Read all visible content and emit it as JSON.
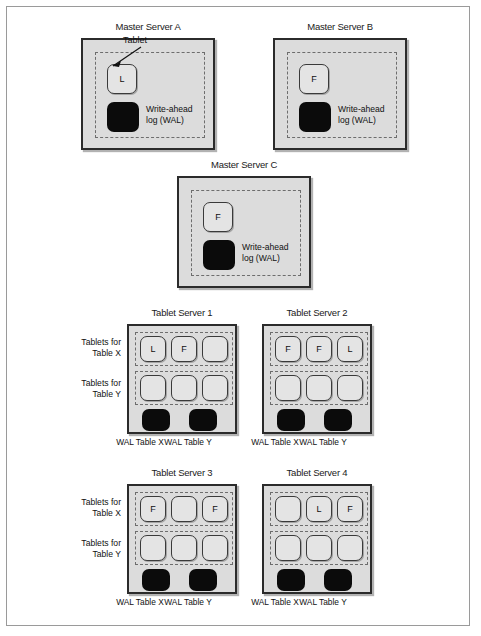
{
  "figure": {
    "type": "distributed-database-architecture-diagram",
    "colors": {
      "server_fill": "#dcdcdc",
      "server_border": "#2b2b2b",
      "tablet_fill": "#e4e4e4",
      "tablet_border": "#3a3a3a",
      "wal_fill": "#0b0b0b",
      "dashed_border": "#6d6d6d",
      "page_background": "#ffffff",
      "text": "#111111"
    },
    "wal_caption": "Write-ahead\nlog (WAL)",
    "wal_caption_line1": "Write-ahead",
    "wal_caption_line2": "log (WAL)",
    "callout": {
      "label": "Tablet"
    }
  },
  "master_servers": [
    {
      "id": "master-server-a",
      "title": "Master Server A",
      "tablet_label": "L",
      "has_callout": true,
      "wal_caption_line1": "Write-ahead",
      "wal_caption_line2": "log (WAL)"
    },
    {
      "id": "master-server-b",
      "title": "Master Server B",
      "tablet_label": "F",
      "has_callout": false,
      "wal_caption_line1": "Write-ahead",
      "wal_caption_line2": "log (WAL)"
    },
    {
      "id": "master-server-c",
      "title": "Master Server C",
      "tablet_label": "F",
      "has_callout": false,
      "wal_caption_line1": "Write-ahead",
      "wal_caption_line2": "log (WAL)"
    }
  ],
  "tablet_servers": [
    {
      "id": "tablet-server-1",
      "title": "Tablet Server 1",
      "row_labels": {
        "table_x_line1": "Tablets for",
        "table_x_line2": "Table X",
        "table_y_line1": "Tablets for",
        "table_y_line2": "Table Y"
      },
      "show_row_labels": true,
      "table_x_tablets": [
        "L",
        "F",
        ""
      ],
      "table_y_tablets": [
        "",
        "",
        ""
      ],
      "wal_labels": [
        "WAL Table X",
        "WAL Table Y"
      ]
    },
    {
      "id": "tablet-server-2",
      "title": "Tablet Server 2",
      "row_labels": {
        "table_x_line1": "Tablets for",
        "table_x_line2": "Table X",
        "table_y_line1": "Tablets for",
        "table_y_line2": "Table Y"
      },
      "show_row_labels": false,
      "table_x_tablets": [
        "F",
        "F",
        "L"
      ],
      "table_y_tablets": [
        "",
        "",
        ""
      ],
      "wal_labels": [
        "WAL Table X",
        "WAL Table Y"
      ]
    },
    {
      "id": "tablet-server-3",
      "title": "Tablet Server 3",
      "row_labels": {
        "table_x_line1": "Tablets for",
        "table_x_line2": "Table X",
        "table_y_line1": "Tablets for",
        "table_y_line2": "Table Y"
      },
      "show_row_labels": true,
      "table_x_tablets": [
        "F",
        "",
        "F"
      ],
      "table_y_tablets": [
        "",
        "",
        ""
      ],
      "wal_labels": [
        "WAL Table X",
        "WAL Table Y"
      ]
    },
    {
      "id": "tablet-server-4",
      "title": "Tablet Server 4",
      "row_labels": {
        "table_x_line1": "Tablets for",
        "table_x_line2": "Table X",
        "table_y_line1": "Tablets for",
        "table_y_line2": "Table Y"
      },
      "show_row_labels": false,
      "table_x_tablets": [
        "",
        "L",
        "F"
      ],
      "table_y_tablets": [
        "",
        "",
        ""
      ],
      "wal_labels": [
        "WAL Table X",
        "WAL Table Y"
      ]
    }
  ]
}
